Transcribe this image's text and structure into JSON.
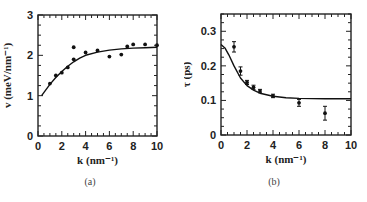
{
  "chart_data": [
    {
      "panel": "(a)",
      "type": "scatter",
      "xlabel": "k (nm⁻¹)",
      "ylabel": "v (meV/nm⁻¹)",
      "xlim": [
        0,
        10
      ],
      "ylim": [
        0,
        3
      ],
      "xticks": [
        "0",
        "2",
        "4",
        "6",
        "8",
        "10"
      ],
      "yticks": [
        "0",
        "1",
        "2",
        "3"
      ],
      "grid": false,
      "series": [
        {
          "name": "data",
          "style": "points",
          "x": [
            1.0,
            1.5,
            2.0,
            2.5,
            3.0,
            3.0,
            4.0,
            5.0,
            6.0,
            7.0,
            7.5,
            8.0,
            9.0,
            10.0
          ],
          "y": [
            1.3,
            1.5,
            1.57,
            1.7,
            1.9,
            2.2,
            2.07,
            2.12,
            1.97,
            2.02,
            2.22,
            2.27,
            2.27,
            2.25
          ]
        },
        {
          "name": "fit",
          "style": "line",
          "x": [
            0.3,
            0.5,
            1.0,
            1.5,
            2.0,
            2.5,
            3.0,
            3.5,
            4.0,
            5.0,
            6.0,
            7.0,
            8.0,
            9.0,
            10.0
          ],
          "y": [
            1.0,
            1.08,
            1.28,
            1.45,
            1.6,
            1.73,
            1.84,
            1.93,
            2.0,
            2.08,
            2.13,
            2.16,
            2.18,
            2.19,
            2.2
          ]
        }
      ]
    },
    {
      "panel": "(b)",
      "type": "scatter",
      "xlabel": "k (nm⁻¹)",
      "ylabel": "τ (ps)",
      "xlim": [
        0,
        10
      ],
      "ylim": [
        0,
        0.35
      ],
      "xticks": [
        "0",
        "2",
        "4",
        "6",
        "8",
        "10"
      ],
      "yticks": [
        "0",
        "0.1",
        "0.2",
        "0.3"
      ],
      "grid": false,
      "series": [
        {
          "name": "data",
          "style": "points-with-errorbars",
          "x": [
            1.0,
            1.5,
            2.0,
            2.5,
            3.0,
            4.0,
            6.0,
            8.0
          ],
          "y": [
            0.255,
            0.185,
            0.152,
            0.138,
            0.127,
            0.113,
            0.093,
            0.063
          ],
          "err": [
            0.015,
            0.012,
            0.006,
            0.006,
            0.005,
            0.005,
            0.01,
            0.02
          ]
        },
        {
          "name": "fit",
          "style": "line",
          "x": [
            0.0,
            0.3,
            0.6,
            1.0,
            1.5,
            2.0,
            2.5,
            3.0,
            4.0,
            5.0,
            6.0,
            8.0,
            10.0
          ],
          "y": [
            0.262,
            0.252,
            0.232,
            0.2,
            0.165,
            0.143,
            0.13,
            0.121,
            0.112,
            0.108,
            0.106,
            0.105,
            0.105
          ]
        }
      ]
    }
  ],
  "captions": {
    "a": "(a)",
    "b": "(b)"
  }
}
